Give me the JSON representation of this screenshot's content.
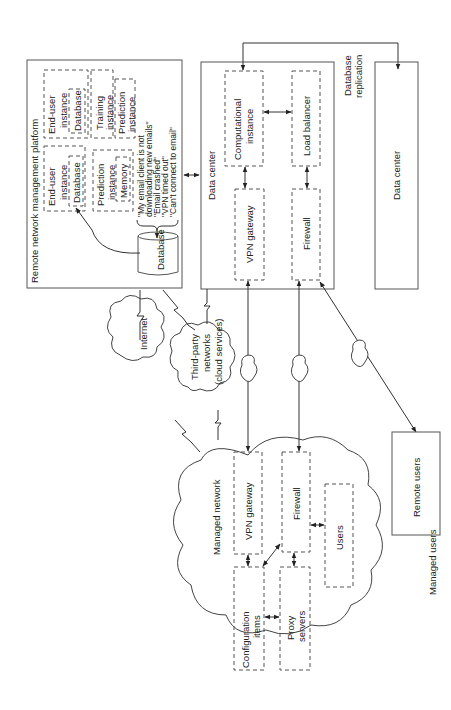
{
  "platform": {
    "title": "Remote network management platform",
    "end_user_instance_1": {
      "label1": "End-user",
      "label2": "instance",
      "db": "Database"
    },
    "end_user_instance_2": {
      "label1": "End-user",
      "label2": "instance",
      "db": "Database"
    },
    "training_instance": {
      "label1": "Training",
      "label2": "instance"
    },
    "prediction_instance_1": {
      "label1": "Prediction",
      "label2": "instance",
      "memory": "Memory"
    },
    "prediction_instance_2": {
      "label1": "Prediction",
      "label2": "instance"
    },
    "database": "Database",
    "incidents": [
      "\"My email client is not",
      "downloading new emails\"",
      "\"Email crashed\"",
      "\"VPN timed out\"",
      "\"Can't connect to email\""
    ]
  },
  "data_center_main": {
    "title": "Data center",
    "computational_instance": {
      "label1": "Computational",
      "label2": "instance"
    },
    "load_balancer": "Load balancer",
    "vpn_gateway": "VPN gateway",
    "firewall": "Firewall"
  },
  "replication_label": {
    "line1": "Database",
    "line2": "replication"
  },
  "data_center_secondary": {
    "title": "Data center"
  },
  "networks": {
    "internet": "Internet",
    "third_party": {
      "line1": "Third-party",
      "line2": "networks",
      "line3": "(cloud services)"
    }
  },
  "managed_network": {
    "title": "Managed network",
    "vpn_gateway": "VPN gateway",
    "firewall": "Firewall",
    "configuration_items": {
      "line1": "Configuration",
      "line2": "items"
    },
    "proxy_servers": {
      "line1": "Proxy",
      "line2": "servers"
    },
    "users": "Users"
  },
  "remote_users": "Remote users",
  "managed_users": "Managed users"
}
